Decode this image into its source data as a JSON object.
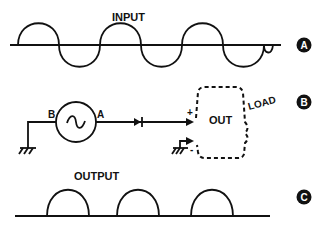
{
  "panels": {
    "a": {
      "marker": "A",
      "label": "INPUT",
      "waveform": "sine (full AC)"
    },
    "b": {
      "marker": "B",
      "source_terminal_left": "B",
      "source_terminal_right": "A",
      "source_symbol": "~",
      "output_label": "OUT",
      "load_label": "LOAD",
      "plus_sign": "+",
      "minus_sign": "-"
    },
    "c": {
      "marker": "C",
      "label": "OUTPUT",
      "waveform": "half-wave rectified (positive humps)"
    }
  },
  "colors": {
    "ink": "#111111",
    "background": "#ffffff"
  }
}
